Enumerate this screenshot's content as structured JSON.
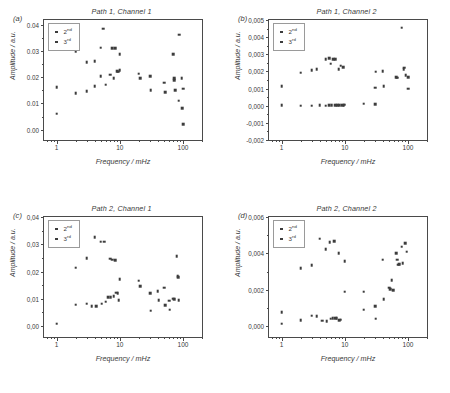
{
  "figure": {
    "axis_labels": {
      "x": "Frequency / mHz",
      "y": "Amplitude / a.u."
    },
    "legend": {
      "second": "2",
      "second_sup": "nd",
      "third": "3",
      "third_sup": "rd"
    },
    "xticks": [
      {
        "v": 1,
        "label": "1"
      },
      {
        "v": 10,
        "label": "10"
      },
      {
        "v": 100,
        "label": "100"
      }
    ],
    "xlim": [
      0.63,
      200
    ]
  },
  "chart_data": [
    {
      "type": "scatter",
      "panel": "(a)",
      "title": "Path 1, Channel 1",
      "xlabel": "Frequency / mHz",
      "ylabel": "Amplitude / a.u.",
      "xscale": "log",
      "xlim": [
        0.63,
        200
      ],
      "ylim": [
        -0.004,
        0.042
      ],
      "yticks": [
        0.0,
        0.01,
        0.02,
        0.03,
        0.04
      ],
      "ytick_labels": [
        "0.00",
        "0.01",
        "0.02",
        "0.03",
        "0.04"
      ],
      "grid": false,
      "legend_position": "top-left",
      "series": [
        {
          "name": "2nd",
          "points": [
            [
              1,
              0.0162
            ],
            [
              1,
              0.0061
            ],
            [
              2,
              0.0301
            ],
            [
              2,
              0.014
            ],
            [
              3,
              0.0259
            ],
            [
              3,
              0.0147
            ],
            [
              4,
              0.0261
            ],
            [
              4,
              0.0167
            ],
            [
              5,
              0.0314
            ],
            [
              5,
              0.0204
            ],
            [
              5.5,
              0.0386
            ],
            [
              6,
              0.0172
            ],
            [
              7,
              0.021
            ],
            [
              7.5,
              0.0313
            ],
            [
              8,
              0.0196
            ],
            [
              8.5,
              0.0312
            ],
            [
              9,
              0.0224
            ],
            [
              9.5,
              0.0222
            ],
            [
              10,
              0.029
            ],
            [
              10,
              0.0228
            ],
            [
              20,
              0.0214
            ],
            [
              21,
              0.0196
            ],
            [
              30,
              0.0204
            ],
            [
              31,
              0.0151
            ],
            [
              50,
              0.018
            ],
            [
              52,
              0.0144
            ],
            [
              70,
              0.029
            ],
            [
              72,
              0.0196
            ],
            [
              73,
              0.0189
            ],
            [
              75,
              0.015
            ],
            [
              85,
              0.0111
            ],
            [
              88,
              0.0364
            ],
            [
              95,
              0.0196
            ],
            [
              98,
              0.0082
            ],
            [
              100,
              0.0157
            ],
            [
              100,
              0.0021
            ]
          ]
        },
        {
          "name": "3rd",
          "points": []
        }
      ]
    },
    {
      "type": "scatter",
      "panel": "(b)",
      "title": "Path 1, Channel 2",
      "xlabel": "Frequency / mHz",
      "ylabel": "Amplitude / a.u.",
      "xscale": "log",
      "xlim": [
        0.63,
        200
      ],
      "ylim": [
        -0.002,
        0.005
      ],
      "yticks": [
        -0.002,
        -0.001,
        0.0,
        0.001,
        0.002,
        0.003,
        0.004,
        0.005
      ],
      "ytick_labels": [
        "-0,002",
        "-0,001",
        "0,000",
        "0,001",
        "0,002",
        "0,003",
        "0,004",
        "0,005"
      ],
      "grid": false,
      "legend_position": "top-left",
      "series": [
        {
          "name": "2nd",
          "points": [
            [
              1,
              0.00114
            ],
            [
              2,
              0.00192
            ],
            [
              3,
              0.00207
            ],
            [
              3.6,
              0.00213
            ],
            [
              5,
              0.0027
            ],
            [
              5.6,
              0.00276
            ],
            [
              6,
              0.00245
            ],
            [
              6.5,
              0.00272
            ],
            [
              7,
              0.00273
            ],
            [
              8,
              0.00212
            ],
            [
              8.6,
              0.00233
            ],
            [
              9.5,
              0.00226
            ],
            [
              30,
              0.00104
            ],
            [
              31,
              0.00199
            ],
            [
              40,
              0.002
            ],
            [
              41,
              0.00114
            ],
            [
              65,
              0.00165
            ],
            [
              67,
              0.00163
            ],
            [
              80,
              0.00455
            ],
            [
              85,
              0.00212
            ],
            [
              88,
              0.00222
            ],
            [
              92,
              0.00178
            ],
            [
              100,
              0.00165
            ],
            [
              100,
              0.001
            ]
          ]
        },
        {
          "name": "3rd",
          "points": [
            [
              1,
              2e-05
            ],
            [
              2,
              1e-05
            ],
            [
              3,
              1e-05
            ],
            [
              4,
              2e-05
            ],
            [
              5,
              1e-05
            ],
            [
              5.6,
              2e-05
            ],
            [
              6.2,
              2e-05
            ],
            [
              7,
              2e-05
            ],
            [
              7.6,
              3e-05
            ],
            [
              8.2,
              3e-05
            ],
            [
              9,
              4e-05
            ],
            [
              9.6,
              4e-05
            ],
            [
              10,
              5e-05
            ],
            [
              20,
              0.00011
            ],
            [
              30,
              8e-05
            ]
          ]
        }
      ]
    },
    {
      "type": "scatter",
      "panel": "(c)",
      "title": "Path 2, Channel 1",
      "xlabel": "Frequency / mHz",
      "ylabel": "Amplitude / a.u.",
      "xscale": "log",
      "xlim": [
        0.63,
        200
      ],
      "ylim": [
        -0.004,
        0.04
      ],
      "yticks": [
        0.0,
        0.01,
        0.02,
        0.03,
        0.04
      ],
      "ytick_labels": [
        "0,00",
        "0,01",
        "0,02",
        "0,03",
        "0,04"
      ],
      "grid": false,
      "legend_position": "top-left",
      "series": [
        {
          "name": "2nd",
          "points": [
            [
              1,
              0.0009
            ],
            [
              2,
              0.0214
            ],
            [
              2,
              0.0079
            ],
            [
              3,
              0.025
            ],
            [
              3,
              0.0082
            ],
            [
              3.6,
              0.0074
            ],
            [
              4,
              0.0326
            ],
            [
              4.2,
              0.0073
            ],
            [
              5,
              0.031
            ],
            [
              5.2,
              0.0082
            ],
            [
              5.6,
              0.031
            ],
            [
              6,
              0.0089
            ],
            [
              6.6,
              0.0105
            ],
            [
              7,
              0.0247
            ],
            [
              7.2,
              0.0107
            ],
            [
              7.6,
              0.0244
            ],
            [
              8,
              0.011
            ],
            [
              8.4,
              0.0242
            ],
            [
              8.8,
              0.0122
            ],
            [
              9.2,
              0.012
            ],
            [
              9.6,
              0.0095
            ],
            [
              10,
              0.0173
            ],
            [
              20,
              0.0166
            ],
            [
              21,
              0.0146
            ],
            [
              30,
              0.0121
            ],
            [
              31,
              0.0056
            ],
            [
              40,
              0.0128
            ],
            [
              41,
              0.0096
            ],
            [
              50,
              0.0141
            ],
            [
              52,
              0.0076
            ],
            [
              60,
              0.0093
            ],
            [
              62,
              0.006
            ],
            [
              70,
              0.01
            ],
            [
              72,
              0.0098
            ],
            [
              80,
              0.0257
            ],
            [
              82,
              0.0183
            ],
            [
              84,
              0.0179
            ],
            [
              85,
              0.0096
            ]
          ]
        },
        {
          "name": "3rd",
          "points": []
        }
      ]
    },
    {
      "type": "scatter",
      "panel": "(d)",
      "title": "Path 2, Channel 2",
      "xlabel": "Frequency / mHz",
      "ylabel": "Amplitude / a.u.",
      "xscale": "log",
      "xlim": [
        0.63,
        200
      ],
      "ylim": [
        -0.0006,
        0.006
      ],
      "yticks": [
        0.0,
        0.002,
        0.004,
        0.006
      ],
      "ytick_labels": [
        "0,000",
        "0,002",
        "0,004",
        "0,006"
      ],
      "grid": false,
      "legend_position": "top-left",
      "series": [
        {
          "name": "2nd",
          "points": [
            [
              1,
              0.00078
            ],
            [
              1,
              0.00013
            ],
            [
              2,
              0.0032
            ],
            [
              2,
              0.00032
            ],
            [
              3,
              0.00335
            ],
            [
              3,
              0.00057
            ],
            [
              3.6,
              0.00055
            ],
            [
              4,
              0.00481
            ],
            [
              4.4,
              0.0003
            ],
            [
              5,
              0.00424
            ],
            [
              5.2,
              0.00026
            ],
            [
              5.8,
              0.00463
            ],
            [
              6,
              0.0004
            ],
            [
              6.4,
              0.00045
            ],
            [
              6.8,
              0.00466
            ],
            [
              7,
              0.00042
            ],
            [
              7.4,
              0.00043
            ],
            [
              8,
              0.004
            ],
            [
              8.2,
              0.00033
            ],
            [
              8.6,
              0.00035
            ],
            [
              10,
              0.00189
            ],
            [
              10,
              0.00358
            ],
            [
              20,
              0.00189
            ],
            [
              20,
              0.00091
            ],
            [
              30,
              0.00111
            ],
            [
              31,
              0.0004
            ],
            [
              40,
              0.00366
            ],
            [
              41,
              0.00148
            ],
            [
              50,
              0.00212
            ],
            [
              52,
              0.00203
            ],
            [
              55,
              0.00253
            ],
            [
              58,
              0.00198
            ],
            [
              65,
              0.004
            ],
            [
              67,
              0.00365
            ],
            [
              70,
              0.00338
            ],
            [
              72,
              0.00342
            ],
            [
              80,
              0.00437
            ],
            [
              82,
              0.00345
            ],
            [
              90,
              0.00455
            ],
            [
              95,
              0.0041
            ]
          ]
        },
        {
          "name": "3rd",
          "points": []
        }
      ]
    }
  ]
}
